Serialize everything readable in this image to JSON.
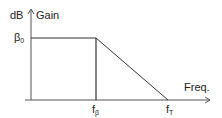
{
  "diagram": {
    "type": "bode-gain-plot",
    "y_axis": {
      "unit_label": "dB",
      "title": "Gain"
    },
    "x_axis": {
      "title": "Freq."
    },
    "levels": {
      "gain_label": "β",
      "gain_sub": "0"
    },
    "markers": [
      {
        "label": "f",
        "sub": "β"
      },
      {
        "label": "f",
        "sub": "T"
      }
    ],
    "colors": {
      "line": "#333333",
      "axis": "#555555",
      "text": "#222222"
    }
  }
}
